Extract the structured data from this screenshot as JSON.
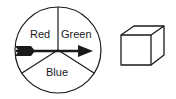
{
  "spinner": {
    "sections": [
      {
        "label": "Red"
      },
      {
        "label": "Green"
      },
      {
        "label": "Blue"
      }
    ],
    "arrow": "pointing-right"
  },
  "cube": {
    "shape": "cube"
  },
  "colors": {
    "stroke": "#1a1a1a",
    "background": "#ffffff"
  }
}
